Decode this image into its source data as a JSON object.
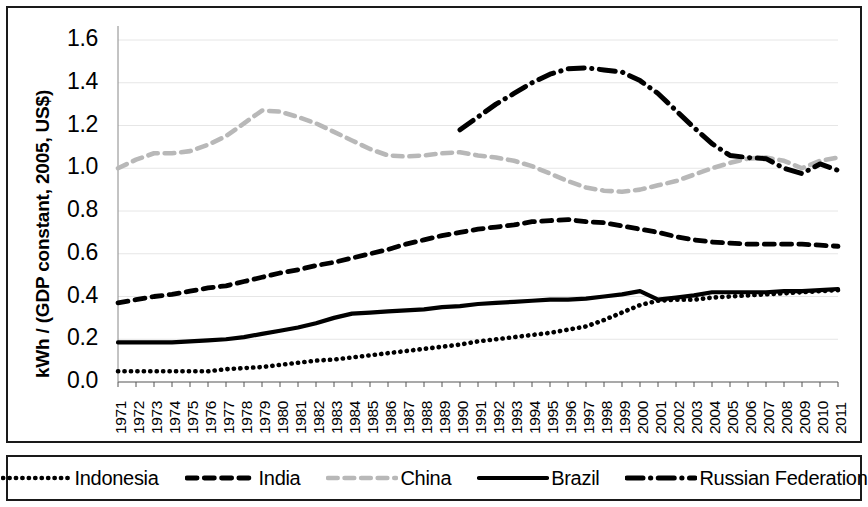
{
  "chart_data": {
    "type": "line",
    "title": "",
    "xlabel": "",
    "ylabel": "kWh / (GDP constant, 2005, US$)",
    "ylim": [
      0.0,
      1.6
    ],
    "yticks": [
      "0.0",
      "0.2",
      "0.4",
      "0.6",
      "0.8",
      "1.0",
      "1.2",
      "1.4",
      "1.6"
    ],
    "grid": true,
    "legend_position": "bottom",
    "categories": [
      "1971",
      "1972",
      "1973",
      "1974",
      "1975",
      "1976",
      "1977",
      "1978",
      "1979",
      "1980",
      "1981",
      "1982",
      "1983",
      "1984",
      "1985",
      "1986",
      "1987",
      "1988",
      "1989",
      "1990",
      "1991",
      "1992",
      "1993",
      "1994",
      "1995",
      "1996",
      "1997",
      "1998",
      "1999",
      "2000",
      "2001",
      "2002",
      "2003",
      "2004",
      "2005",
      "2006",
      "2007",
      "2008",
      "2009",
      "2010",
      "2011"
    ],
    "series": [
      {
        "name": "Indonesia",
        "style": "dotted",
        "color": "#000000",
        "values": [
          0.05,
          0.05,
          0.05,
          0.05,
          0.05,
          0.05,
          0.06,
          0.065,
          0.07,
          0.08,
          0.09,
          0.1,
          0.105,
          0.115,
          0.125,
          0.135,
          0.145,
          0.155,
          0.165,
          0.175,
          0.19,
          0.2,
          0.21,
          0.22,
          0.23,
          0.245,
          0.26,
          0.29,
          0.325,
          0.36,
          0.38,
          0.385,
          0.385,
          0.395,
          0.4,
          0.405,
          0.41,
          0.415,
          0.42,
          0.425,
          0.43
        ]
      },
      {
        "name": "India",
        "style": "dashed",
        "color": "#000000",
        "values": [
          0.37,
          0.385,
          0.4,
          0.41,
          0.425,
          0.44,
          0.45,
          0.47,
          0.49,
          0.51,
          0.525,
          0.545,
          0.56,
          0.58,
          0.6,
          0.62,
          0.645,
          0.665,
          0.685,
          0.7,
          0.715,
          0.725,
          0.735,
          0.75,
          0.755,
          0.76,
          0.75,
          0.745,
          0.73,
          0.715,
          0.7,
          0.68,
          0.665,
          0.655,
          0.65,
          0.645,
          0.645,
          0.645,
          0.645,
          0.64,
          0.635
        ]
      },
      {
        "name": "China",
        "style": "dashed",
        "color": "#b8b8b8",
        "values": [
          1.0,
          1.04,
          1.07,
          1.07,
          1.08,
          1.11,
          1.15,
          1.21,
          1.27,
          1.265,
          1.24,
          1.21,
          1.17,
          1.13,
          1.09,
          1.06,
          1.055,
          1.06,
          1.07,
          1.075,
          1.06,
          1.05,
          1.035,
          1.01,
          0.975,
          0.94,
          0.91,
          0.895,
          0.89,
          0.9,
          0.92,
          0.94,
          0.97,
          1.0,
          1.025,
          1.045,
          1.05,
          1.035,
          1.0,
          1.035,
          1.05
        ]
      },
      {
        "name": "Brazil",
        "style": "solid",
        "color": "#000000",
        "values": [
          0.185,
          0.185,
          0.185,
          0.185,
          0.19,
          0.195,
          0.2,
          0.21,
          0.225,
          0.24,
          0.255,
          0.275,
          0.3,
          0.32,
          0.325,
          0.33,
          0.335,
          0.34,
          0.35,
          0.355,
          0.365,
          0.37,
          0.375,
          0.38,
          0.385,
          0.385,
          0.39,
          0.4,
          0.41,
          0.425,
          0.385,
          0.395,
          0.405,
          0.42,
          0.42,
          0.42,
          0.42,
          0.425,
          0.425,
          0.43,
          0.435
        ]
      },
      {
        "name": "Russian Federation",
        "style": "dashdot",
        "color": "#000000",
        "start_year": "1990",
        "values": [
          null,
          null,
          null,
          null,
          null,
          null,
          null,
          null,
          null,
          null,
          null,
          null,
          null,
          null,
          null,
          null,
          null,
          null,
          null,
          1.18,
          1.24,
          1.3,
          1.35,
          1.4,
          1.44,
          1.465,
          1.47,
          1.46,
          1.45,
          1.41,
          1.35,
          1.27,
          1.19,
          1.115,
          1.06,
          1.05,
          1.045,
          1.0,
          0.975,
          1.02,
          0.99
        ]
      }
    ]
  },
  "legend": {
    "entries": [
      {
        "label": "Indonesia",
        "style": "dotted"
      },
      {
        "label": "India",
        "style": "dashed"
      },
      {
        "label": "China",
        "style": "dashed-gray"
      },
      {
        "label": "Brazil",
        "style": "solid"
      },
      {
        "label": "Russian Federation",
        "style": "dashdot"
      }
    ]
  }
}
